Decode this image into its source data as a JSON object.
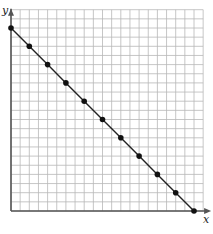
{
  "chart_data": {
    "type": "line",
    "title": "",
    "xlabel": "x",
    "ylabel": "y",
    "x": [
      0,
      2,
      4,
      6,
      8,
      10,
      12,
      14,
      16,
      18,
      20
    ],
    "series": [
      {
        "name": "line",
        "values": [
          20,
          18,
          16,
          14,
          12,
          10,
          8,
          6,
          4,
          2,
          0
        ],
        "markers": true
      }
    ],
    "xlim": [
      0,
      21
    ],
    "ylim": [
      0,
      22
    ],
    "grid": true,
    "grid_step": 1,
    "tick_labels": false,
    "legend": null
  },
  "style": {
    "grid_color": "#b8b8b8",
    "axis_color": "#555555",
    "line_color": "#222222",
    "marker_color": "#111111",
    "background": "#ffffff"
  },
  "layout": {
    "origin_px": [
      11,
      211
    ],
    "cell_px": 9.15
  }
}
